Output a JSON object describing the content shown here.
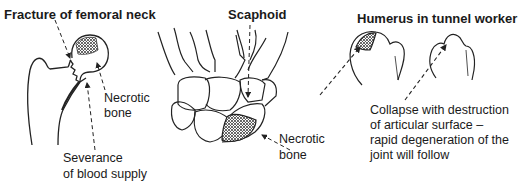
{
  "panels": {
    "femur": {
      "title": "Fracture of femoral neck",
      "necrotic_label_line1": "Necrotic",
      "necrotic_label_line2": "bone",
      "severance_line1": "Severance",
      "severance_line2": "of blood supply"
    },
    "scaphoid": {
      "title": "Scaphoid",
      "necrotic_label_line1": "Necrotic",
      "necrotic_label_line2": "bone"
    },
    "humerus": {
      "title": "Humerus in tunnel worker",
      "caption_line1": "Collapse with destruction",
      "caption_line2": "of articular surface –",
      "caption_line3": "rapid degeneration of the",
      "caption_line4": "joint will follow"
    }
  }
}
